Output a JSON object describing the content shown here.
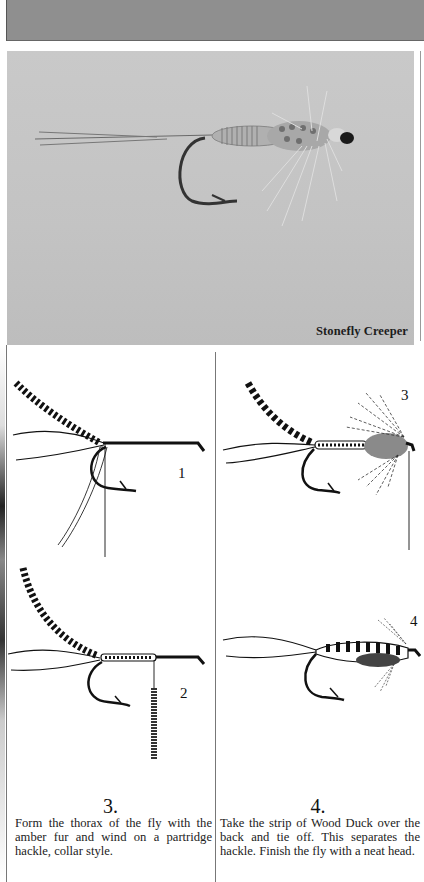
{
  "page": {
    "type": "book-page"
  },
  "photo": {
    "caption": "Stonefly Creeper",
    "background_color": "#c5c5c5"
  },
  "figures": [
    {
      "number": "1",
      "panel": "left-top"
    },
    {
      "number": "2",
      "panel": "left-bottom"
    },
    {
      "number": "3",
      "panel": "right-top"
    },
    {
      "number": "4",
      "panel": "right-bottom"
    }
  ],
  "steps": [
    {
      "number": "3.",
      "text": "Form the thorax of the fly with the amber fur and wind on a partridge hackle, collar style."
    },
    {
      "number": "4.",
      "text": "Take the strip of Wood Duck over the back and tie off. This separates the hackle. Finish the fly with a neat head."
    }
  ]
}
